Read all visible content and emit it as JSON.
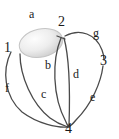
{
  "figure": {
    "kind": "multigraph-diagram",
    "background_color": "#ffffff",
    "stroke_color": "#4a4a4a",
    "label_color": "#1a1a1a",
    "loop_fill_color": "#e2e2e2"
  },
  "nodes": [
    {
      "id": "1",
      "label": "1",
      "x": 8,
      "y": 48
    },
    {
      "id": "2",
      "label": "2",
      "x": 62,
      "y": 22
    },
    {
      "id": "3",
      "label": "3",
      "x": 104,
      "y": 61
    },
    {
      "id": "4",
      "label": "4",
      "x": 69,
      "y": 127
    }
  ],
  "edge_labels": [
    {
      "id": "a",
      "label": "a",
      "x": 32,
      "y": 14
    },
    {
      "id": "b",
      "label": "b",
      "x": 48,
      "y": 65
    },
    {
      "id": "c",
      "label": "c",
      "x": 44,
      "y": 94
    },
    {
      "id": "d",
      "label": "d",
      "x": 76,
      "y": 74
    },
    {
      "id": "e",
      "label": "e",
      "x": 93,
      "y": 97
    },
    {
      "id": "f",
      "label": "f",
      "x": 7,
      "y": 88
    },
    {
      "id": "g",
      "label": "g",
      "x": 96,
      "y": 33
    }
  ]
}
